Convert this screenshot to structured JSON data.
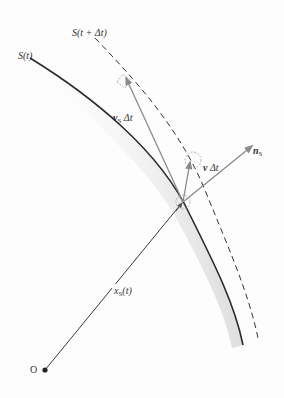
{
  "diagram": {
    "labels": {
      "surface_t": "S(t)",
      "surface_t_dt": "S(t + Δt)",
      "vs_dt": {
        "main": "v",
        "sub": "S",
        "tail": " Δt"
      },
      "v_dt": {
        "main": "v",
        "tail": " Δt"
      },
      "normal": {
        "main": "n",
        "sub": "S"
      },
      "position": {
        "main": "x",
        "sub": "S",
        "tail": "(t)"
      },
      "origin": "O"
    },
    "colors": {
      "background": "#fdfdfd",
      "surface_line": "#2a2a2a",
      "surface_shadow": "#9a9a9a",
      "dashed_surface": "#333333",
      "arrows": "#8a8a8a",
      "position_line": "#3a3a3a",
      "helper_circles": "#a0a0a0"
    }
  }
}
